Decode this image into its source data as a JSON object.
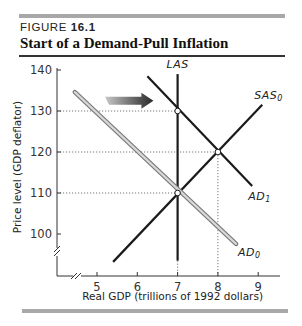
{
  "figure": {
    "label_prefix": "FIGURE ",
    "label_number": "16.1",
    "title": "Start of a Demand-Pull Inflation"
  },
  "chart_data": {
    "type": "line",
    "title": "Start of a Demand-Pull Inflation",
    "xlabel": "Real GDP (trillions of 1992 dollars)",
    "ylabel": "Price level (GDP deflator)",
    "xlim": [
      4.5,
      9.5
    ],
    "ylim": [
      95,
      140
    ],
    "axis_breaks": {
      "x": true,
      "y": true
    },
    "x_ticks": [
      5,
      6,
      7,
      8,
      9
    ],
    "x_tick_labels": [
      "5",
      "6",
      "7",
      "8",
      "9"
    ],
    "y_ticks": [
      100,
      110,
      120,
      130,
      140
    ],
    "y_tick_labels": [
      "100",
      "110",
      "120",
      "130",
      "140"
    ],
    "grid": false,
    "series": [
      {
        "name": "LAS",
        "label": "LAS",
        "sub": "",
        "style": "black",
        "points": [
          [
            7,
            139
          ],
          [
            7,
            93.5
          ]
        ]
      },
      {
        "name": "SAS0",
        "label": "SAS",
        "sub": "0",
        "style": "black",
        "points": [
          [
            5.4,
            93.2
          ],
          [
            9.1,
            131.5
          ]
        ]
      },
      {
        "name": "AD0",
        "label": "AD",
        "sub": "0",
        "style": "gray-double",
        "points": [
          [
            4.45,
            134.6
          ],
          [
            8.45,
            97.6
          ]
        ]
      },
      {
        "name": "AD1",
        "label": "AD",
        "sub": "1",
        "style": "black",
        "points": [
          [
            6.25,
            138.5
          ],
          [
            8.85,
            111.7
          ]
        ]
      }
    ],
    "equilibrium_points": [
      {
        "name": "initial-equilibrium",
        "x": 7,
        "y": 110
      },
      {
        "name": "new-short-run-equilibrium",
        "x": 8,
        "y": 120
      },
      {
        "name": "las-ad1-intersection",
        "x": 7,
        "y": 130
      }
    ],
    "guide_lines": [
      {
        "type": "horizontal",
        "y": 130,
        "x_to": 7
      },
      {
        "type": "horizontal",
        "y": 120,
        "x_to": 8
      },
      {
        "type": "horizontal",
        "y": 110,
        "x_to": 7
      },
      {
        "type": "vertical",
        "x": 8,
        "y_to": 120
      },
      {
        "type": "vertical",
        "x": 7,
        "y_to": 93.5
      }
    ],
    "annotations": [
      {
        "type": "arrow",
        "direction": "right",
        "meaning": "aggregate demand increases",
        "from": [
          5.2,
          132.5
        ],
        "to": [
          6.4,
          132.5
        ]
      }
    ]
  }
}
